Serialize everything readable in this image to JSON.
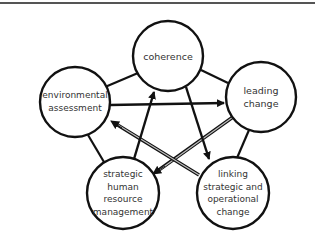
{
  "diagram": {
    "type": "cycle-network",
    "colors": {
      "stroke": "#111111",
      "gray_arrow": "#8a8a8a",
      "text": "#333333",
      "background": "#ffffff",
      "top_rule": "#555555"
    },
    "nodes": [
      {
        "id": "coherence",
        "label": "coherence",
        "cx": 168,
        "cy": 56,
        "r": 35
      },
      {
        "id": "leading",
        "label": "leading\nchange",
        "cx": 261,
        "cy": 97,
        "r": 35
      },
      {
        "id": "linking",
        "label": "linking\nstrategic and\noperational\nchange",
        "cx": 233,
        "cy": 193,
        "r": 36
      },
      {
        "id": "hrm",
        "label": "strategic\nhuman\nresource\nmanagement",
        "cx": 123,
        "cy": 193,
        "r": 36
      },
      {
        "id": "environmental",
        "label": "environmental\nassessment",
        "cx": 75,
        "cy": 102,
        "r": 35
      }
    ],
    "connections": [
      {
        "from": "coherence",
        "to": "environmental",
        "style": "line"
      },
      {
        "from": "coherence",
        "to": "leading",
        "style": "line"
      },
      {
        "from": "environmental",
        "to": "hrm",
        "style": "line"
      },
      {
        "from": "leading",
        "to": "linking",
        "style": "line"
      },
      {
        "from": "environmental",
        "to": "leading",
        "style": "black-arrow"
      },
      {
        "from": "hrm",
        "to": "coherence",
        "style": "black-arrow"
      },
      {
        "from": "coherence",
        "to": "linking",
        "style": "black-arrow"
      },
      {
        "from": "leading",
        "to": "hrm",
        "style": "gray-arrow"
      },
      {
        "from": "linking",
        "to": "environmental",
        "style": "gray-arrow"
      }
    ]
  }
}
